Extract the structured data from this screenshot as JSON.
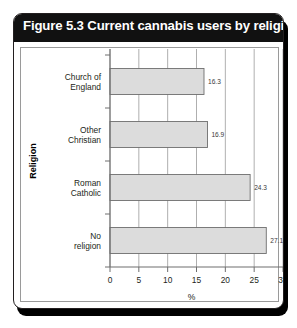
{
  "figure": {
    "title": "Figure 5.3 Current cannabis users by religion",
    "title_bar_color": "#111111",
    "title_text_color": "#ffffff",
    "frame_color": "#231f20",
    "background": "#ffffff"
  },
  "chart_data": {
    "type": "bar",
    "orientation": "horizontal",
    "title": "Figure 5.3 Current cannabis users by religion",
    "categories": [
      "Church of England",
      "Other Christian",
      "Roman Catholic",
      "No religion"
    ],
    "values": [
      16.3,
      16.9,
      24.3,
      27.1
    ],
    "value_labels": [
      "16.3",
      "16.9",
      "24.3",
      "27.1"
    ],
    "xlabel": "%",
    "ylabel": "Religion",
    "xlim": [
      0,
      30
    ],
    "xticks": [
      0,
      5,
      10,
      15,
      20,
      25,
      30
    ],
    "xtick_labels": [
      "0",
      "5",
      "10",
      "15",
      "20",
      "25",
      "30"
    ],
    "grid": "vertical",
    "legend": "none",
    "bar_fill": "#dcdcdc",
    "bar_stroke": "#6e6e6e",
    "gridline_color": "#9a9a9a",
    "axis_color": "#6e6e6e"
  },
  "category_lines": [
    [
      "Church of",
      "England"
    ],
    [
      "Other",
      "Christian"
    ],
    [
      "Roman",
      "Catholic"
    ],
    [
      "No",
      "religion"
    ]
  ]
}
